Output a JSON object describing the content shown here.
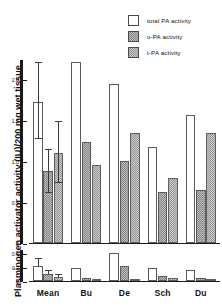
{
  "chart_data": {
    "type": "bar",
    "title": "",
    "subtitle": "",
    "xlabel": "",
    "ylabel": "Plasminogen activator activity (IU)/200 mg wet tissue",
    "categories": [
      "Mean",
      "Bu",
      "De",
      "Sch",
      "Du"
    ],
    "grid": false,
    "legend_position": "top-right",
    "legend": [
      "total PA activity",
      "u-PA activity",
      "t-PA activity"
    ],
    "panels": [
      {
        "name": "upper-panel",
        "ylim": [
          0,
          2.25
        ],
        "yticks": [
          0,
          0.5,
          1.0,
          1.5,
          2.0
        ],
        "yticklabels": [
          "0",
          "0.5",
          "1.0",
          "1.5",
          "2.0"
        ],
        "series": [
          {
            "name": "total PA activity",
            "values": [
              1.72,
              2.21,
              1.95,
              1.18,
              1.57
            ],
            "errors": [
              0.48,
              null,
              null,
              null,
              null
            ],
            "error_low": [
              0.45,
              null,
              null,
              null,
              null
            ]
          },
          {
            "name": "u-PA activity",
            "values": [
              0.88,
              1.23,
              1.0,
              0.62,
              0.65
            ],
            "errors": [
              0.26,
              null,
              null,
              null,
              null
            ],
            "error_low": [
              0.27,
              null,
              null,
              null,
              null
            ]
          },
          {
            "name": "t-PA activity",
            "values": [
              1.1,
              0.95,
              1.35,
              0.8,
              1.35
            ],
            "errors": [
              0.38,
              null,
              null,
              null,
              null
            ],
            "error_low": [
              0.36,
              null,
              null,
              null,
              null
            ]
          }
        ]
      },
      {
        "name": "lower-panel",
        "ylim": [
          0,
          0.45
        ],
        "yticks": [
          0,
          0.2,
          0.4
        ],
        "yticklabels": [
          "0",
          "0.2",
          "0.4"
        ],
        "series": [
          {
            "name": "total PA activity",
            "values": [
              0.215,
              0.185,
              0.4,
              0.185,
              0.155
            ],
            "errors": [
              0.1,
              null,
              null,
              null,
              null
            ],
            "error_low": [
              0.0,
              null,
              null,
              null,
              null
            ]
          },
          {
            "name": "u-PA activity",
            "values": [
              0.095,
              0.045,
              0.205,
              0.075,
              0.045
            ],
            "errors": [
              0.045,
              null,
              null,
              null,
              null
            ],
            "error_low": [
              0.0,
              null,
              null,
              null,
              null
            ]
          },
          {
            "name": "t-PA activity",
            "values": [
              0.055,
              0.022,
              0.022,
              0.042,
              0.022
            ],
            "errors": [
              0.035,
              null,
              null,
              null,
              null
            ],
            "error_low": [
              0.0,
              null,
              null,
              null,
              null
            ]
          }
        ]
      }
    ]
  },
  "colors": {
    "total": "#ffffff",
    "upa": "#bdbdbd",
    "tpa": "#c9c9c9",
    "axis": "#1a1a1a",
    "outline": "#4a4a4a"
  }
}
